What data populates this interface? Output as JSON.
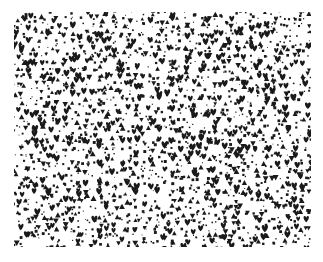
{
  "canvas": {
    "width": 323,
    "height": 262,
    "background_color": "#ffffff"
  },
  "pattern": {
    "name": "random-glyph-scatter",
    "description": "Dense randomized scatter of small black glyphs on a white field",
    "field": {
      "x": 14,
      "y": 12,
      "width": 297,
      "height": 235,
      "background_color": "#ffffff"
    },
    "margin": {
      "left": 14,
      "top": 12,
      "right": 12,
      "bottom": 15,
      "color": "#ffffff"
    },
    "glyph_color": "#1a1a1a",
    "glyph_types": [
      {
        "id": "heart",
        "name": "heart-glyph",
        "weight": 0.18,
        "size_min": 4.0,
        "size_max": 6.5
      },
      {
        "id": "triangle-up",
        "name": "triangle-up-glyph",
        "weight": 0.13,
        "size_min": 3.5,
        "size_max": 6.0
      },
      {
        "id": "triangle-down",
        "name": "triangle-down-glyph",
        "weight": 0.12,
        "size_min": 3.5,
        "size_max": 6.0
      },
      {
        "id": "square",
        "name": "square-dot-glyph",
        "weight": 0.4,
        "size_min": 1.4,
        "size_max": 3.0
      },
      {
        "id": "dot",
        "name": "micro-dot-glyph",
        "weight": 0.17,
        "size_min": 0.8,
        "size_max": 1.6
      }
    ],
    "glyph_count": 2600,
    "seed": 20240517,
    "cell_size": 7.2,
    "jitter": 0.85
  }
}
